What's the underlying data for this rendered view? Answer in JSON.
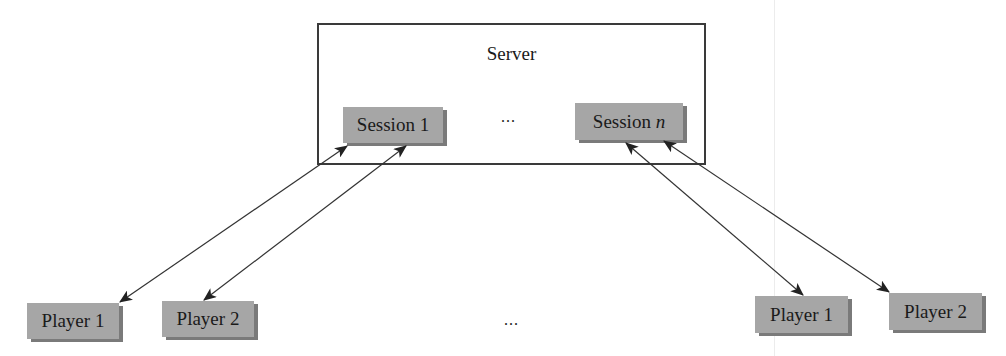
{
  "server": {
    "title": "Server",
    "sessions": [
      {
        "label": "Session 1",
        "id": "session-1"
      },
      {
        "label": "Session ",
        "suffix": "n",
        "id": "session-n"
      }
    ],
    "ellipsis": "..."
  },
  "players": {
    "left_group": [
      {
        "label": "Player 1"
      },
      {
        "label": "Player 2"
      }
    ],
    "right_group": [
      {
        "label": "Player 1"
      },
      {
        "label": "Player 2"
      }
    ],
    "ellipsis": "..."
  },
  "colors": {
    "node_fill": "#a6a6a6",
    "node_shadow": "#7a7a7a",
    "border": "#3a3a3a",
    "arrow": "#333333"
  },
  "connections": [
    {
      "from": "Session 1",
      "to": "Player 1 (left)",
      "bidirectional": true
    },
    {
      "from": "Session 1",
      "to": "Player 2 (left)",
      "bidirectional": true
    },
    {
      "from": "Session n",
      "to": "Player 1 (right)",
      "bidirectional": true
    },
    {
      "from": "Session n",
      "to": "Player 2 (right)",
      "bidirectional": true
    }
  ]
}
